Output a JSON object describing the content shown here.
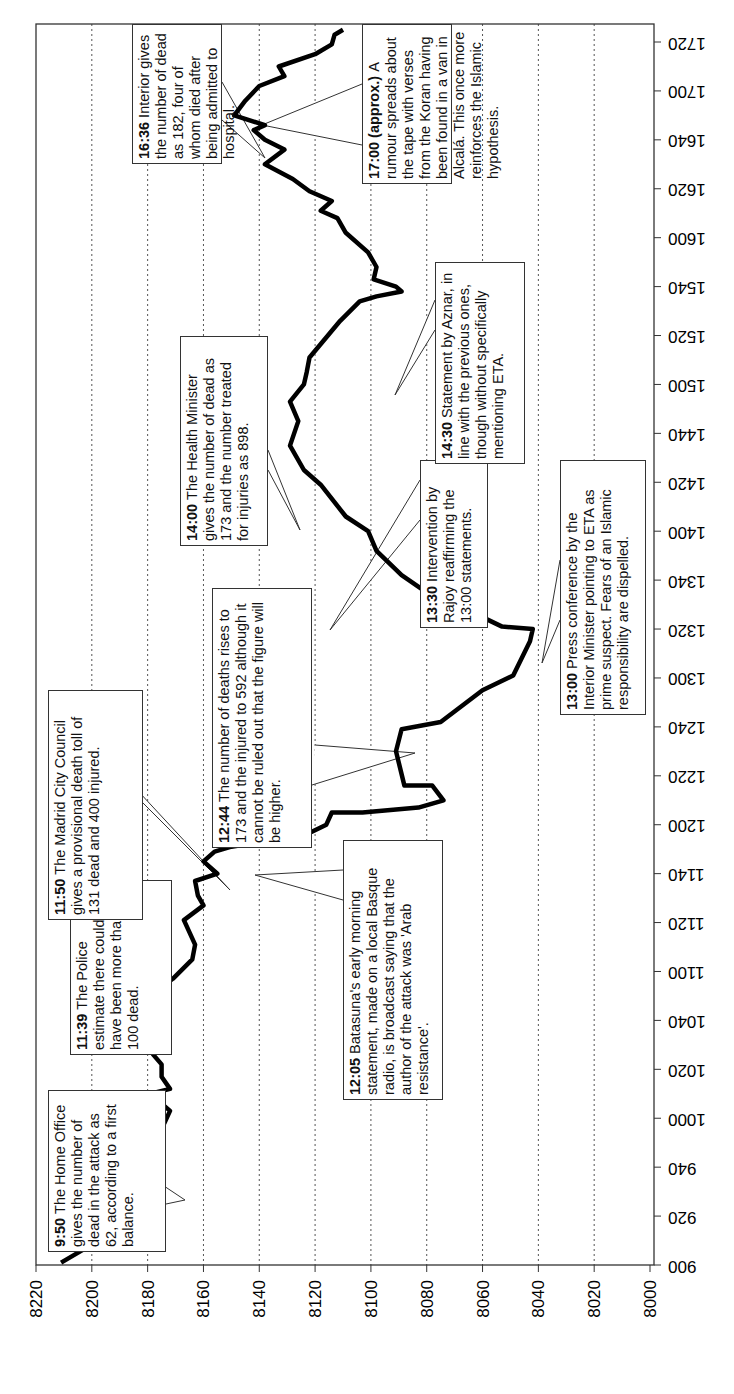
{
  "chart_data": {
    "type": "line",
    "orientation": "rotated 90 degrees counter-clockwise (time axis vertical on right, value axis horizontal at bottom)",
    "title": "",
    "xlabel": "Time (hhmm)",
    "ylabel": "",
    "x_ticks": [
      "900",
      "920",
      "940",
      "1000",
      "1020",
      "1040",
      "1100",
      "1120",
      "1140",
      "1200",
      "1220",
      "1240",
      "1300",
      "1320",
      "1340",
      "1400",
      "1420",
      "1440",
      "1500",
      "1520",
      "1540",
      "1600",
      "1620",
      "1640",
      "1700",
      "1720"
    ],
    "y_ticks": [
      "8220",
      "8200",
      "8180",
      "8160",
      "8140",
      "8120",
      "8100",
      "8080",
      "8060",
      "8040",
      "8020",
      "8000"
    ],
    "ylim": [
      8000,
      8220
    ],
    "grid": "dotted vertical lines at each value tick",
    "series": [
      {
        "name": "index",
        "points_minutes_from_900_and_value": [
          [
            1,
            8211
          ],
          [
            7,
            8202
          ],
          [
            11,
            8190
          ],
          [
            14,
            8187
          ],
          [
            18,
            8189
          ],
          [
            20,
            8195
          ],
          [
            24,
            8191
          ],
          [
            26,
            8189
          ],
          [
            30,
            8195
          ],
          [
            33,
            8190
          ],
          [
            36,
            8193
          ],
          [
            42,
            8190
          ],
          [
            47,
            8185
          ],
          [
            53,
            8183
          ],
          [
            58,
            8174
          ],
          [
            63,
            8172
          ],
          [
            67,
            8176
          ],
          [
            70,
            8179
          ],
          [
            72,
            8172
          ],
          [
            77,
            8175
          ],
          [
            82,
            8175
          ],
          [
            86,
            8178
          ],
          [
            91,
            8173
          ],
          [
            96,
            8176
          ],
          [
            98,
            8182
          ],
          [
            102,
            8179
          ],
          [
            106,
            8174
          ],
          [
            112,
            8177
          ],
          [
            117,
            8171
          ],
          [
            125,
            8164
          ],
          [
            131,
            8163
          ],
          [
            141,
            8167
          ],
          [
            147,
            8160
          ],
          [
            151,
            8162
          ],
          [
            157,
            8163
          ],
          [
            160,
            8155
          ],
          [
            165,
            8160
          ],
          [
            169,
            8156
          ],
          [
            171,
            8150
          ],
          [
            173,
            8139
          ],
          [
            175,
            8125
          ],
          [
            180,
            8116
          ],
          [
            185,
            8114
          ],
          [
            185,
            8103
          ],
          [
            187,
            8083
          ],
          [
            190,
            8074
          ],
          [
            196,
            8078
          ],
          [
            196,
            8088
          ],
          [
            210,
            8091
          ],
          [
            219,
            8089
          ],
          [
            222,
            8075
          ],
          [
            235,
            8060
          ],
          [
            241,
            8049
          ],
          [
            255,
            8043
          ],
          [
            260,
            8042
          ],
          [
            261,
            8053
          ],
          [
            267,
            8064
          ],
          [
            271,
            8075
          ],
          [
            282,
            8089
          ],
          [
            292,
            8098
          ],
          [
            300,
            8101
          ],
          [
            306,
            8109
          ],
          [
            319,
            8118
          ],
          [
            325,
            8124
          ],
          [
            335,
            8129
          ],
          [
            345,
            8126
          ],
          [
            353,
            8129
          ],
          [
            360,
            8124
          ],
          [
            365,
            8123
          ],
          [
            371,
            8122
          ],
          [
            386,
            8111
          ],
          [
            394,
            8104
          ],
          [
            396,
            8098
          ],
          [
            398,
            8089
          ],
          [
            400,
            8091
          ],
          [
            403,
            8099
          ],
          [
            408,
            8098
          ],
          [
            414,
            8101
          ],
          [
            422,
            8109
          ],
          [
            428,
            8112
          ],
          [
            431,
            8118
          ],
          [
            435,
            8114
          ],
          [
            439,
            8122
          ],
          [
            444,
            8128
          ],
          [
            450,
            8138
          ],
          [
            456,
            8131
          ],
          [
            460,
            8138
          ],
          [
            464,
            8142
          ],
          [
            466,
            8138
          ],
          [
            470,
            8149
          ],
          [
            476,
            8145
          ],
          [
            482,
            8140
          ],
          [
            486,
            8131
          ],
          [
            490,
            8133
          ],
          [
            495,
            8120
          ],
          [
            499,
            8114
          ],
          [
            503,
            8113
          ],
          [
            505,
            8110
          ]
        ]
      }
    ],
    "annotations": [
      {
        "time": "9:50",
        "text": "The Home Office gives the number of dead in the attack as 62, according to a first balance."
      },
      {
        "time": "11:39",
        "text": "The Police estimate there could have been more than 100 dead."
      },
      {
        "time": "11:50",
        "text": "The Madrid City Council gives a provisional death toll of 131 dead and 400 injured."
      },
      {
        "time": "12:05",
        "text": "Batasuna's early morning statement, made on a local Basque radio, is broadcast saying that the author of the attack was 'Arab resistance'."
      },
      {
        "time": "12:44",
        "text": "The number of deaths rises to 173 and the injured to 592 although it cannot be ruled out that the figure will be higher."
      },
      {
        "time": "13:00",
        "text": "Press conference by the Interior Minister pointing to ETA as prime suspect. Fears of an Islamic responsibility are dispelled."
      },
      {
        "time": "13:30",
        "text": "Intervention by Rajoy reaffirming the 13:00 statements."
      },
      {
        "time": "14:00",
        "text": "The Health Minister gives the number of dead as 173 and the number treated for injuries as 898."
      },
      {
        "time": "14:30",
        "text": "Statement by Aznar, in line with the previous ones, though without specifically mentioning ETA."
      },
      {
        "time": "16:36",
        "text": "Interior gives the number of dead as 182, four of whom died after being admitted to hospital."
      },
      {
        "time": "17:00 (approx.)",
        "text": "A rumour spreads about the tape with verses from the Koran having been found in a van in Alcalá. This once more reinforces the Islamic hypothesis."
      }
    ]
  },
  "annotations": {
    "a950": {
      "time": "9:50",
      "text": "The Home Office gives the number of dead in the attack as 62, according to a first balance."
    },
    "a1139": {
      "time": "11:39",
      "text": "The Police estimate there could have been more than 100 dead."
    },
    "a1150": {
      "time": "11:50",
      "text": "The Madrid City Council gives a provisional death toll of 131 dead and 400 injured."
    },
    "a1205": {
      "time": "12:05",
      "text": "Batasuna's early morning statement, made on a local Basque radio, is broadcast saying that the author of the attack was 'Arab resistance'."
    },
    "a1244": {
      "time": "12:44",
      "text": "The number of deaths rises to 173 and the injured to 592 although it cannot be ruled out that the figure will be higher."
    },
    "a1300": {
      "time": "13:00",
      "text": "Press conference by the Interior Minister pointing to ETA as prime suspect. Fears of an Islamic responsibility are dispelled."
    },
    "a1330": {
      "time": "13:30",
      "text": "Intervention by Rajoy reaffirming the 13:00 statements."
    },
    "a1400": {
      "time": "14:00",
      "text": "The Health Minister gives the number of dead as 173 and the number treated for injuries as 898."
    },
    "a1430": {
      "time": "14:30",
      "text": "Statement by Aznar, in line with the previous ones, though without specifically mentioning ETA."
    },
    "a1636": {
      "time": "16:36",
      "text": "Interior gives the number of dead as 182, four of whom died after being admitted to hospital."
    },
    "a1700": {
      "time": "17:00 (approx.)",
      "text": "A rumour spreads about the tape with verses from the Koran having been found in a van in Alcalá. This once more reinforces the Islamic hypothesis."
    }
  }
}
